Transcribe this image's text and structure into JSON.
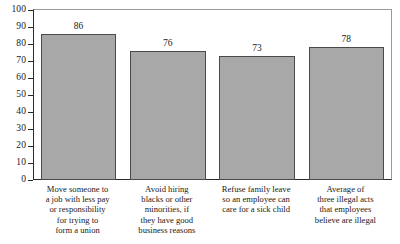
{
  "chart_data": {
    "type": "bar",
    "title": "",
    "subtitle": "",
    "xlabel": "",
    "ylabel": "",
    "ylim": [
      0,
      100
    ],
    "ytick_step": 10,
    "yticks": [
      0,
      10,
      20,
      30,
      40,
      50,
      60,
      70,
      80,
      90,
      100
    ],
    "ytick_labels": [
      "0",
      "10",
      "20",
      "30",
      "40",
      "50",
      "60",
      "70",
      "80",
      "90",
      "100"
    ],
    "grid": false,
    "legend": false,
    "legend_position": "none",
    "bar_color": "#a8a8a8",
    "bar_edge_color": "#4a4a4a",
    "axis_color": "#2b2b2b",
    "show_value_labels": true,
    "categories": [
      "Move someone to a job with less pay or responsibility for trying to form a union",
      "Avoid hiring blacks or other minorities, if they have good business reasons",
      "Refuse family leave so an employee can care for a sick child",
      "Average of three illegal acts that employees believe are illegal"
    ],
    "category_lines": [
      [
        "Move someone to",
        "a job with less pay",
        "or responsibility",
        "for trying to",
        "form a union"
      ],
      [
        "Avoid hiring",
        "blacks or other",
        "minorities, if",
        "they have good",
        "business reasons"
      ],
      [
        "Refuse family leave",
        "so an employee can",
        "care for a sick child"
      ],
      [
        "Average of",
        "three illegal acts",
        "that employees",
        "believe are illegal"
      ]
    ],
    "values": [
      86,
      76,
      73,
      78
    ],
    "value_labels": [
      "86",
      "76",
      "73",
      "78"
    ]
  }
}
